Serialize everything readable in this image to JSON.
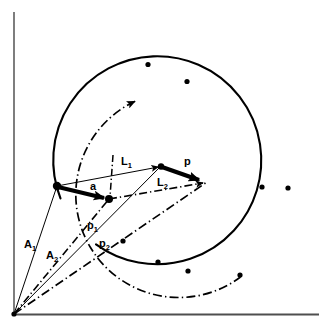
{
  "figure": {
    "background_color": "#ffffff",
    "ink_color": "#000000",
    "axis_color": "#5a5a5a",
    "width": 328,
    "height": 333
  },
  "axes": {
    "origin": {
      "x": 14,
      "y": 314
    },
    "vertical_axis": {
      "x1": 14,
      "y1": 314,
      "x2": 14,
      "y2": 12
    },
    "horizontal_axis": {
      "x1": 14,
      "y1": 314,
      "x2": 318,
      "y2": 314
    }
  },
  "labels": {
    "vector_a": {
      "text": "a",
      "sub": "",
      "x": 92,
      "y": 189
    },
    "vector_p": {
      "text": "p",
      "sub": "",
      "x": 186,
      "y": 164
    },
    "line_L1": {
      "text": "L",
      "sub": "1",
      "x": 124,
      "y": 164
    },
    "line_L2": {
      "text": "L",
      "sub": "2",
      "x": 160,
      "y": 185
    },
    "line_A1": {
      "text": "A",
      "sub": "1",
      "x": 26,
      "y": 247
    },
    "line_A2": {
      "text": "A",
      "sub": "2",
      "x": 48,
      "y": 258
    },
    "line_p1": {
      "text": "p",
      "sub": "1",
      "x": 89,
      "y": 228
    },
    "line_p2": {
      "text": "p",
      "sub": "2",
      "x": 101,
      "y": 246
    }
  },
  "vertices": {
    "origin": {
      "x": 14,
      "y": 314,
      "name": "origin"
    },
    "left_node": {
      "x": 57,
      "y": 186,
      "name": "tail-of-a"
    },
    "mid_node": {
      "x": 109,
      "y": 199,
      "name": "head-of-a"
    },
    "upper_node": {
      "x": 161,
      "y": 166,
      "name": "head-of-L1"
    },
    "tip_node": {
      "x": 207,
      "y": 182,
      "name": "head-of-p"
    }
  },
  "vectors": [
    {
      "name": "a",
      "from": "left_node",
      "to": "mid_node",
      "style": "thick-solid",
      "arrow": true
    },
    {
      "name": "p",
      "from": "upper_node",
      "to": "tip_node",
      "style": "thick-solid",
      "arrow": true
    },
    {
      "name": "L1",
      "from": "left_node",
      "to": "upper_node",
      "style": "thin-solid",
      "arrow": true
    },
    {
      "name": "L2",
      "from": "mid_node",
      "to": "tip_node",
      "style": "thin-dashdot",
      "arrow": true
    },
    {
      "name": "A1",
      "from": "origin",
      "to": "left_node",
      "style": "thin-solid",
      "arrow": false
    },
    {
      "name": "A2",
      "from": "origin",
      "to": "mid_node",
      "style": "thin-dashdot",
      "arrow": false
    },
    {
      "name": "p1",
      "from": "origin",
      "to": "upper_node",
      "style": "thin-solid",
      "arrow": false
    },
    {
      "name": "p2",
      "from": "origin",
      "to": "tip_node",
      "style": "thin-dashdot",
      "arrow": false
    }
  ],
  "curves": [
    {
      "name": "solid-locus-circle",
      "style": "solid",
      "center": {
        "x": 160,
        "y": 168
      },
      "radius": 104,
      "start_angle_deg": 163,
      "end_angle_deg": -128,
      "markers_deg": [
        120,
        15,
        -65,
        -110
      ]
    },
    {
      "name": "dashdot-locus-circle",
      "style": "dashdot",
      "center": {
        "x": 186,
        "y": 181
      },
      "radius": 103,
      "start_angle_deg": 152,
      "end_angle_deg": -130,
      "arrow_at_start_end": "start",
      "markers_deg": [
        110,
        8,
        -70,
        -108
      ]
    },
    {
      "name": "short-dashdot-tick",
      "style": "dashdot",
      "from": {
        "x": 113,
        "y": 156
      },
      "to": {
        "x": 110,
        "y": 196
      }
    }
  ],
  "legend_note": ""
}
